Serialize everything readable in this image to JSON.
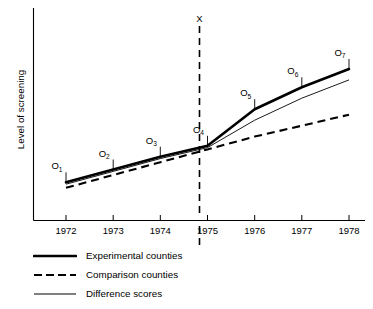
{
  "chart_data": {
    "type": "line",
    "title": "",
    "xlabel": "",
    "ylabel": "Level of screening",
    "grid": false,
    "legend_position": "below-axis-left",
    "x": [
      1972,
      1973,
      1974,
      1975,
      1976,
      1977,
      1978
    ],
    "xtick_labels": [
      "1972",
      "1973",
      "1974",
      "1975",
      "1976",
      "1977",
      "1978"
    ],
    "xlim": [
      1971.6,
      1978.4
    ],
    "ylim": [
      0,
      100
    ],
    "yaxis_ticks_shown": false,
    "observation_labels": [
      "O1",
      "O2",
      "O3",
      "O4",
      "O5",
      "O6",
      "O7"
    ],
    "observation_label_subscripts": [
      "1",
      "2",
      "3",
      "4",
      "5",
      "6",
      "7"
    ],
    "intervention": {
      "label": "X",
      "at_x": 1975,
      "style": "vertical dashed line"
    },
    "series": [
      {
        "name": "Experimental counties",
        "style": "thick solid",
        "values": [
          22,
          29,
          36,
          42,
          62,
          74,
          84
        ]
      },
      {
        "name": "Comparison counties",
        "style": "dashed",
        "values": [
          19,
          26,
          33,
          40,
          47,
          53,
          59
        ]
      },
      {
        "name": "Difference scores",
        "style": "thin solid",
        "values": [
          21,
          28,
          35,
          41,
          56,
          68,
          78
        ]
      }
    ]
  },
  "axis": {
    "ylabel": "Level of screening"
  },
  "legend": {
    "items": [
      {
        "label": "Experimental counties",
        "key": "solid-thick-line-icon"
      },
      {
        "label": "Comparison counties",
        "key": "dashed-line-icon"
      },
      {
        "label": "Difference scores",
        "key": "solid-thin-line-icon"
      }
    ]
  }
}
